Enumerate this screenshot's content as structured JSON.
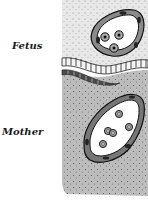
{
  "diagram": {
    "type": "placenta-cross-section",
    "labels": {
      "fetus": "Fetus",
      "mother": "Mother"
    },
    "regions": [
      {
        "name": "fetal-tissue",
        "position": "upper",
        "fill": "#e6e6e6"
      },
      {
        "name": "placental-membrane",
        "position": "middle",
        "fill": "#555555"
      },
      {
        "name": "maternal-tissue",
        "position": "lower",
        "fill": "#bdbdbd"
      }
    ],
    "vessels": [
      {
        "name": "fetal-capillary",
        "cells": 3
      },
      {
        "name": "maternal-blood-vessel",
        "cells": 5
      }
    ]
  }
}
